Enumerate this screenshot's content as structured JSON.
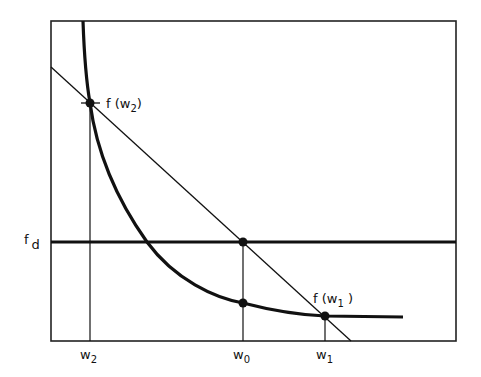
{
  "diagram": {
    "type": "secant-method-illustration",
    "colors": {
      "ink": "#111111",
      "background": "#ffffff"
    },
    "frame": {
      "x0": 51,
      "y0": 21,
      "x1": 456,
      "y1": 341
    },
    "labels": {
      "f_w2": {
        "base": "f (w",
        "sub": "2",
        "close": ")"
      },
      "f_w1": {
        "base": "f (w",
        "sub": "1",
        "close": " )"
      },
      "f_d": {
        "base": "f",
        "sub": "d"
      },
      "w2": {
        "base": "w",
        "sub": "2"
      },
      "w0": {
        "base": "w",
        "sub": "0"
      },
      "w1": {
        "base": "w",
        "sub": "1"
      }
    },
    "points": {
      "f_w2": {
        "x": 90,
        "y": 103
      },
      "w0_on_fd": {
        "x": 243,
        "y": 242
      },
      "w0_on_curve": {
        "x": 243,
        "y": 303
      },
      "f_w1": {
        "x": 325,
        "y": 316
      }
    },
    "lines": {
      "f_d_level_y": 242,
      "secant": {
        "x0": 51,
        "y0": 67,
        "x1": 351,
        "y1": 341
      },
      "w2_x": 90,
      "w0_x": 243,
      "w1_x": 325
    }
  }
}
